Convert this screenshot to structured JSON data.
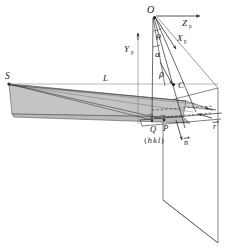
{
  "figure": {
    "background_color": "#ffffff",
    "line_color": "#2b2b2b",
    "slab_fill": "#c9c9c9",
    "plane_fill": "#ffffff",
    "width": 229,
    "height": 249
  },
  "points": {
    "O": "O",
    "S": "S",
    "C": "C",
    "P": "P",
    "Q": "Q"
  },
  "axes": {
    "z_axis": "Z",
    "z_axis_sub": "p",
    "x_axis": "X",
    "x_axis_sub": "p",
    "y_axis": "Y",
    "y_axis_sub": "p"
  },
  "angles": {
    "theta": "θ",
    "alpha": "α"
  },
  "distances": {
    "rho_upper": "ρ",
    "rho_lower": "ρ",
    "L": "L"
  },
  "vectors": {
    "n": "n",
    "r": "r"
  },
  "miller_index": {
    "open_paren": "(",
    "h": "h",
    "k": "k",
    "l": "l",
    "close_paren": ")"
  }
}
